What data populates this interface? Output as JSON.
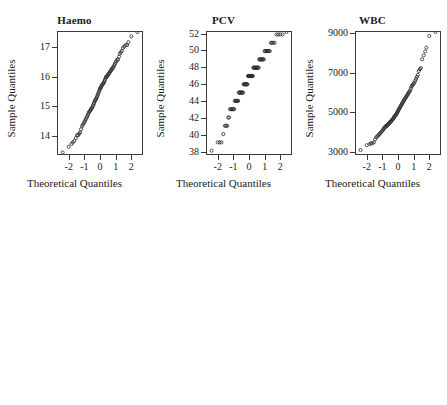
{
  "figure": {
    "kind": "qq-plot-grid",
    "rows": 2,
    "cols": 3,
    "marker": "open-circle",
    "marker_color": "#2b2b2b",
    "frame_color": "#3a3a3a",
    "background": "#ffffff"
  },
  "chart_data": [
    {
      "type": "scatter",
      "title": "Haemo",
      "xlabel": "Theoretical Quantiles",
      "ylabel": "Sample Quantiles",
      "grid": false,
      "legend": null,
      "xticks": [
        -2,
        -1,
        0,
        1,
        2
      ],
      "xticklabels": [
        "-2",
        "-1",
        "0",
        "1",
        "2"
      ],
      "yticks": [
        14,
        15,
        16,
        17
      ],
      "yticklabels": [
        "14",
        "15",
        "16",
        "17"
      ],
      "xlim": [
        -2.75,
        2.75
      ],
      "ylim": [
        13.35,
        17.55
      ],
      "x": [
        -2.45,
        -2.05,
        -1.86,
        -1.78,
        -1.68,
        -1.58,
        -1.5,
        -1.43,
        -1.36,
        -1.3,
        -1.24,
        -1.18,
        -1.13,
        -1.07,
        -1.02,
        -0.97,
        -0.93,
        -0.88,
        -0.84,
        -0.79,
        -0.75,
        -0.71,
        -0.67,
        -0.63,
        -0.59,
        -0.55,
        -0.51,
        -0.47,
        -0.43,
        -0.39,
        -0.36,
        -0.32,
        -0.28,
        -0.25,
        -0.21,
        -0.17,
        -0.14,
        -0.1,
        -0.07,
        -0.03,
        0.0,
        0.03,
        0.07,
        0.1,
        0.14,
        0.17,
        0.21,
        0.25,
        0.28,
        0.32,
        0.36,
        0.39,
        0.43,
        0.47,
        0.51,
        0.55,
        0.59,
        0.63,
        0.67,
        0.71,
        0.75,
        0.79,
        0.84,
        0.88,
        0.93,
        0.97,
        1.02,
        1.07,
        1.13,
        1.18,
        1.24,
        1.3,
        1.36,
        1.43,
        1.5,
        1.58,
        1.68,
        1.78,
        1.86,
        2.05,
        2.45
      ],
      "y": [
        13.4,
        13.6,
        13.7,
        13.75,
        13.8,
        13.9,
        14.0,
        14.0,
        14.05,
        14.1,
        14.2,
        14.3,
        14.35,
        14.4,
        14.45,
        14.5,
        14.55,
        14.6,
        14.65,
        14.7,
        14.75,
        14.8,
        14.82,
        14.85,
        14.9,
        14.92,
        14.95,
        15.0,
        15.05,
        15.1,
        15.15,
        15.2,
        15.22,
        15.25,
        15.3,
        15.35,
        15.4,
        15.45,
        15.5,
        15.55,
        15.6,
        15.62,
        15.65,
        15.7,
        15.72,
        15.75,
        15.78,
        15.8,
        15.85,
        15.9,
        15.95,
        16.0,
        16.0,
        16.05,
        16.05,
        16.1,
        16.12,
        16.15,
        16.2,
        16.22,
        16.25,
        16.3,
        16.3,
        16.35,
        16.4,
        16.45,
        16.5,
        16.55,
        16.6,
        16.6,
        16.7,
        16.8,
        16.85,
        16.9,
        17.0,
        17.05,
        17.1,
        17.1,
        17.2,
        17.4
      ]
    },
    {
      "type": "scatter",
      "title": "PCV",
      "xlabel": "Theoretical Quantiles",
      "ylabel": "Sample Quantiles",
      "grid": false,
      "legend": null,
      "xticks": [
        -2,
        -1,
        0,
        1,
        2
      ],
      "xticklabels": [
        "-2",
        "-1",
        "0",
        "1",
        "2"
      ],
      "yticks": [
        38,
        40,
        42,
        44,
        46,
        48,
        50,
        52
      ],
      "yticklabels": [
        "38",
        "40",
        "42",
        "44",
        "46",
        "48",
        "50",
        "52"
      ],
      "xlim": [
        -2.75,
        2.75
      ],
      "ylim": [
        37.6,
        52.3
      ],
      "x": [
        -2.45,
        -2.05,
        -1.92,
        -1.8,
        -1.68,
        -1.58,
        -1.5,
        -1.43,
        -1.36,
        -1.3,
        -1.24,
        -1.18,
        -1.13,
        -1.07,
        -1.02,
        -0.97,
        -0.93,
        -0.88,
        -0.84,
        -0.79,
        -0.75,
        -0.71,
        -0.67,
        -0.63,
        -0.59,
        -0.55,
        -0.51,
        -0.47,
        -0.43,
        -0.39,
        -0.36,
        -0.32,
        -0.28,
        -0.25,
        -0.21,
        -0.17,
        -0.14,
        -0.1,
        -0.07,
        -0.03,
        0.0,
        0.03,
        0.07,
        0.1,
        0.14,
        0.17,
        0.21,
        0.25,
        0.28,
        0.32,
        0.36,
        0.39,
        0.43,
        0.47,
        0.51,
        0.55,
        0.59,
        0.63,
        0.67,
        0.71,
        0.75,
        0.79,
        0.84,
        0.88,
        0.93,
        0.97,
        1.02,
        1.07,
        1.13,
        1.18,
        1.24,
        1.3,
        1.36,
        1.43,
        1.5,
        1.58,
        1.68,
        1.8,
        1.92,
        2.05,
        2.2,
        2.45
      ],
      "y": [
        38,
        39,
        39,
        39,
        40,
        41,
        41,
        41,
        42,
        42,
        43,
        43,
        43,
        43,
        43,
        43,
        44,
        44,
        44,
        44,
        44,
        44,
        45,
        45,
        45,
        45,
        45,
        45,
        45,
        45,
        46,
        46,
        46,
        46,
        46,
        46,
        46,
        46,
        47,
        47,
        47,
        47,
        47,
        47,
        47,
        47,
        47,
        47,
        48,
        48,
        48,
        48,
        48,
        48,
        48,
        48,
        48,
        48,
        49,
        49,
        49,
        49,
        49,
        49,
        49,
        49,
        50,
        50,
        50,
        50,
        50,
        50,
        50,
        51,
        51,
        51,
        51,
        52,
        52,
        52,
        52
      ]
    },
    {
      "type": "scatter",
      "title": "WBC",
      "xlabel": "Theoretical Quantiles",
      "ylabel": "Sample Quantiles",
      "grid": false,
      "legend": null,
      "xticks": [
        -2,
        -1,
        0,
        1,
        2
      ],
      "xticklabels": [
        "-2",
        "-1",
        "0",
        "1",
        "2"
      ],
      "yticks": [
        3000,
        5000,
        7000,
        9000
      ],
      "yticklabels": [
        "3000",
        "5000",
        "7000",
        "9000"
      ],
      "xlim": [
        -2.75,
        2.75
      ],
      "ylim": [
        2850,
        9100
      ],
      "x": [
        -2.45,
        -2.05,
        -1.86,
        -1.78,
        -1.68,
        -1.58,
        -1.5,
        -1.43,
        -1.36,
        -1.3,
        -1.24,
        -1.18,
        -1.13,
        -1.07,
        -1.02,
        -0.97,
        -0.93,
        -0.88,
        -0.84,
        -0.79,
        -0.75,
        -0.71,
        -0.67,
        -0.63,
        -0.59,
        -0.55,
        -0.51,
        -0.47,
        -0.43,
        -0.39,
        -0.36,
        -0.32,
        -0.28,
        -0.25,
        -0.21,
        -0.17,
        -0.14,
        -0.1,
        -0.07,
        -0.03,
        0.0,
        0.03,
        0.07,
        0.1,
        0.14,
        0.17,
        0.21,
        0.25,
        0.28,
        0.32,
        0.36,
        0.39,
        0.43,
        0.47,
        0.51,
        0.55,
        0.59,
        0.63,
        0.67,
        0.71,
        0.75,
        0.79,
        0.84,
        0.88,
        0.93,
        0.97,
        1.02,
        1.07,
        1.13,
        1.18,
        1.24,
        1.3,
        1.36,
        1.43,
        1.5,
        1.58,
        1.68,
        1.78,
        1.86,
        2.05,
        2.45
      ],
      "y": [
        3050,
        3300,
        3350,
        3400,
        3400,
        3450,
        3600,
        3700,
        3750,
        3800,
        3850,
        3900,
        3950,
        4000,
        4050,
        4100,
        4150,
        4200,
        4250,
        4250,
        4300,
        4300,
        4350,
        4400,
        4400,
        4450,
        4500,
        4500,
        4550,
        4600,
        4620,
        4650,
        4700,
        4750,
        4800,
        4820,
        4850,
        4900,
        4950,
        5000,
        5050,
        5100,
        5150,
        5200,
        5250,
        5300,
        5350,
        5400,
        5450,
        5500,
        5550,
        5600,
        5650,
        5700,
        5750,
        5800,
        5850,
        5900,
        5950,
        6000,
        6050,
        6100,
        6200,
        6300,
        6350,
        6400,
        6450,
        6500,
        6600,
        6700,
        6800,
        6900,
        7100,
        7200,
        7250,
        7700,
        7900,
        8100,
        8300,
        8900
      ]
    },
    {
      "type": "scatter",
      "title": "Lympho",
      "xlabel": "Theoretical Quantiles",
      "ylabel": "Sample Quantiles",
      "grid": false,
      "legend": null,
      "xticks": [
        -2,
        -1,
        0,
        1,
        2
      ],
      "xticklabels": [
        "-2",
        "-1",
        "0",
        "1",
        "2"
      ],
      "yticks": [
        10,
        20,
        30,
        40,
        50,
        60
      ],
      "yticklabels": [
        "10",
        "20",
        "30",
        "40",
        "50",
        "60"
      ],
      "xlim": [
        -2.75,
        2.75
      ],
      "ylim": [
        6.5,
        62.5
      ],
      "x": [
        -2.45,
        -2.05,
        -1.92,
        -1.8,
        -1.68,
        -1.58,
        -1.5,
        -1.43,
        -1.36,
        -1.3,
        -1.24,
        -1.18,
        -1.13,
        -1.07,
        -1.02,
        -0.97,
        -0.93,
        -0.88,
        -0.84,
        -0.79,
        -0.75,
        -0.71,
        -0.67,
        -0.63,
        -0.59,
        -0.55,
        -0.51,
        -0.47,
        -0.43,
        -0.39,
        -0.36,
        -0.32,
        -0.28,
        -0.25,
        -0.21,
        -0.17,
        -0.14,
        -0.1,
        -0.07,
        -0.03,
        0.0,
        0.03,
        0.07,
        0.1,
        0.14,
        0.17,
        0.21,
        0.25,
        0.28,
        0.32,
        0.36,
        0.39,
        0.43,
        0.47,
        0.51,
        0.55,
        0.59,
        0.63,
        0.67,
        0.71,
        0.75,
        0.79,
        0.84,
        0.88,
        0.93,
        0.97,
        1.02,
        1.07,
        1.13,
        1.18,
        1.24,
        1.3,
        1.36,
        1.43,
        1.5,
        1.58,
        1.68,
        1.8,
        1.92,
        2.05,
        2.45
      ],
      "y": [
        8.5,
        9.0,
        9.0,
        9.0,
        9.2,
        9.5,
        11.0,
        12.0,
        13.0,
        14.0,
        14.5,
        15.0,
        15.5,
        16.0,
        16.5,
        17.0,
        17.5,
        18.0,
        18.5,
        19.0,
        19.5,
        20.0,
        20.2,
        20.5,
        20.8,
        21.0,
        21.3,
        21.5,
        21.8,
        22.0,
        22.3,
        22.5,
        22.8,
        23.0,
        23.3,
        23.5,
        23.8,
        24.0,
        24.3,
        24.5,
        24.8,
        25.0,
        25.3,
        25.5,
        25.8,
        26.0,
        26.3,
        26.5,
        27.0,
        27.3,
        27.5,
        28.0,
        28.5,
        29.0,
        29.5,
        30.0,
        30.5,
        31.0,
        31.5,
        32.0,
        33.0,
        34.0,
        35.0,
        35.5,
        36.0,
        36.5,
        37.0,
        37.5,
        38.0,
        39.0,
        40.0,
        41.0,
        42.0,
        42.5,
        43.0,
        44.0,
        47.0,
        52.0,
        52.0,
        61.0
      ]
    },
    {
      "type": "scatter",
      "title": "Neutro",
      "xlabel": "Theoretical Quantiles",
      "ylabel": "Sample Quantiles",
      "grid": false,
      "legend": null,
      "xticks": [
        -2,
        -1,
        0,
        1,
        2
      ],
      "xticklabels": [
        "-2",
        "-1",
        "0",
        "1",
        "2"
      ],
      "yticks": [
        15,
        20,
        25,
        30,
        35,
        40
      ],
      "yticklabels": [
        "15",
        "20",
        "25",
        "30",
        "35",
        "40"
      ],
      "xlim": [
        -2.75,
        2.75
      ],
      "ylim": [
        12.2,
        42.8
      ],
      "x": [
        -2.45,
        -2.05,
        -1.92,
        -1.8,
        -1.68,
        -1.58,
        -1.5,
        -1.43,
        -1.36,
        -1.3,
        -1.24,
        -1.18,
        -1.13,
        -1.07,
        -1.02,
        -0.97,
        -0.93,
        -0.88,
        -0.84,
        -0.79,
        -0.75,
        -0.71,
        -0.67,
        -0.63,
        -0.59,
        -0.55,
        -0.51,
        -0.47,
        -0.43,
        -0.39,
        -0.36,
        -0.32,
        -0.28,
        -0.25,
        -0.21,
        -0.17,
        -0.14,
        -0.1,
        -0.07,
        -0.03,
        0.0,
        0.03,
        0.07,
        0.1,
        0.14,
        0.17,
        0.21,
        0.25,
        0.28,
        0.32,
        0.36,
        0.39,
        0.43,
        0.47,
        0.51,
        0.55,
        0.59,
        0.63,
        0.67,
        0.71,
        0.75,
        0.79,
        0.84,
        0.88,
        0.93,
        0.97,
        1.02,
        1.07,
        1.13,
        1.18,
        1.24,
        1.3,
        1.36,
        1.43,
        1.5,
        1.58,
        1.68,
        1.8,
        1.92,
        2.05,
        2.2,
        2.45
      ],
      "y": [
        13.2,
        13.3,
        14.0,
        14.2,
        14.5,
        15.0,
        15.5,
        16.0,
        16.2,
        16.5,
        17.0,
        17.5,
        18.0,
        18.2,
        18.5,
        19.0,
        19.2,
        19.5,
        20.0,
        20.2,
        20.5,
        21.0,
        21.2,
        21.5,
        22.0,
        22.2,
        22.5,
        23.0,
        23.2,
        23.5,
        24.0,
        24.2,
        24.5,
        25.0,
        25.0,
        25.2,
        25.5,
        25.8,
        26.0,
        26.2,
        26.5,
        27.0,
        27.2,
        27.5,
        28.0,
        28.2,
        28.5,
        29.0,
        29.2,
        29.5,
        30.0,
        30.2,
        30.5,
        31.0,
        31.2,
        31.5,
        32.0,
        32.2,
        32.5,
        33.0,
        33.2,
        33.5,
        34.0,
        34.0,
        35.5,
        36.0,
        36.5,
        37.0,
        37.5,
        38.0,
        38.2,
        38.5,
        39.0,
        39.0,
        39.0,
        39.0,
        39.0,
        39.0,
        39.0,
        39.0,
        42.0
      ]
    },
    {
      "type": "scatter",
      "title": "Lead",
      "xlabel": "Theoretical Quantiles",
      "ylabel": "Sample Quantiles",
      "grid": false,
      "legend": null,
      "xticks": [
        -2,
        -1,
        0,
        1,
        2
      ],
      "xticklabels": [
        "-2",
        "-1",
        "0",
        "1",
        "2"
      ],
      "yticks": [
        15,
        20,
        25,
        30,
        35
      ],
      "yticklabels": [
        "15",
        "20",
        "25",
        "30",
        "35"
      ],
      "xlim": [
        -2.75,
        2.75
      ],
      "ylim": [
        11.8,
        36.8
      ],
      "x": [
        -2.45,
        -2.2,
        -2.05,
        -1.92,
        -1.8,
        -1.68,
        -1.58,
        -1.5,
        -1.43,
        -1.36,
        -1.3,
        -1.24,
        -1.18,
        -1.13,
        -1.07,
        -1.02,
        -0.97,
        -0.93,
        -0.88,
        -0.84,
        -0.79,
        -0.75,
        -0.71,
        -0.67,
        -0.63,
        -0.59,
        -0.55,
        -0.51,
        -0.47,
        -0.43,
        -0.39,
        -0.36,
        -0.32,
        -0.28,
        -0.25,
        -0.21,
        -0.17,
        -0.14,
        -0.1,
        -0.07,
        -0.03,
        0.0,
        0.03,
        0.07,
        0.1,
        0.14,
        0.17,
        0.21,
        0.25,
        0.28,
        0.32,
        0.36,
        0.39,
        0.43,
        0.47,
        0.51,
        0.55,
        0.59,
        0.63,
        0.67,
        0.71,
        0.75,
        0.79,
        0.84,
        0.88,
        0.93,
        0.97,
        1.02,
        1.07,
        1.13,
        1.18,
        1.24,
        1.3,
        1.36,
        1.43,
        1.5,
        1.58,
        1.68,
        1.8,
        1.92,
        2.05,
        2.2,
        2.45
      ],
      "y": [
        12.5,
        12.5,
        13.5,
        15.0,
        15.0,
        15.0,
        15.0,
        15.5,
        16.0,
        16.0,
        16.0,
        17.0,
        17.0,
        17.0,
        18.0,
        18.0,
        18.0,
        19.0,
        19.0,
        19.0,
        19.0,
        20.0,
        20.0,
        20.0,
        20.0,
        20.0,
        21.0,
        21.0,
        21.0,
        21.0,
        21.0,
        22.0,
        22.0,
        22.0,
        22.0,
        22.0,
        22.0,
        23.0,
        23.0,
        23.0,
        23.0,
        23.0,
        23.0,
        24.0,
        24.0,
        24.0,
        24.0,
        24.0,
        24.0,
        24.0,
        25.0,
        25.0,
        25.0,
        25.0,
        25.0,
        25.0,
        25.0,
        25.0,
        25.0,
        25.0,
        26.0,
        26.0,
        26.0,
        26.0,
        26.0,
        26.0,
        26.0,
        27.0,
        27.0,
        27.0,
        27.0,
        27.0,
        27.0,
        27.0,
        28.0,
        28.0,
        28.0,
        28.0,
        28.0,
        29.0,
        29.0,
        29.0,
        36.0
      ]
    }
  ]
}
